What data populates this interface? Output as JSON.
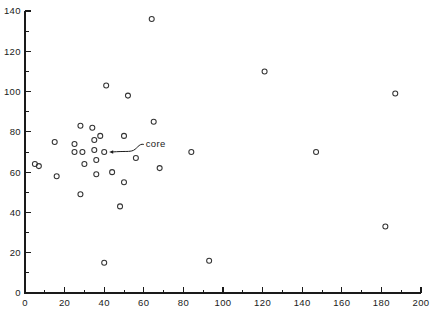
{
  "chart_data": {
    "type": "scatter",
    "title": "",
    "xlabel": "",
    "ylabel": "",
    "xlim": [
      0,
      200
    ],
    "ylim": [
      0,
      140
    ],
    "grid": false,
    "legend": null,
    "x_ticks": [
      0,
      20,
      40,
      60,
      80,
      100,
      120,
      140,
      160,
      180,
      200
    ],
    "x_tick_labels": [
      "0",
      "20",
      "40",
      "60",
      "80",
      "100",
      "120",
      "140",
      "160",
      "180",
      "200"
    ],
    "x_minor_step": 10,
    "y_ticks": [
      0,
      20,
      40,
      60,
      80,
      100,
      120,
      140
    ],
    "y_tick_labels": [
      "0",
      "20",
      "40",
      "60",
      "80",
      "100",
      "120",
      "140"
    ],
    "y_minor_step": 10,
    "marker": "open-circle",
    "marker_radius": 2.5,
    "points": [
      {
        "x": 7,
        "y": 63
      },
      {
        "x": 5,
        "y": 64
      },
      {
        "x": 15,
        "y": 75
      },
      {
        "x": 16,
        "y": 58
      },
      {
        "x": 25,
        "y": 74
      },
      {
        "x": 25,
        "y": 70
      },
      {
        "x": 28,
        "y": 83
      },
      {
        "x": 28,
        "y": 49
      },
      {
        "x": 29,
        "y": 70
      },
      {
        "x": 30,
        "y": 64
      },
      {
        "x": 34,
        "y": 82
      },
      {
        "x": 35,
        "y": 76
      },
      {
        "x": 35,
        "y": 71
      },
      {
        "x": 36,
        "y": 66
      },
      {
        "x": 36,
        "y": 59
      },
      {
        "x": 38,
        "y": 78
      },
      {
        "x": 40,
        "y": 70
      },
      {
        "x": 40,
        "y": 15
      },
      {
        "x": 41,
        "y": 103
      },
      {
        "x": 44,
        "y": 60
      },
      {
        "x": 48,
        "y": 43
      },
      {
        "x": 50,
        "y": 78
      },
      {
        "x": 50,
        "y": 55
      },
      {
        "x": 52,
        "y": 98
      },
      {
        "x": 56,
        "y": 67
      },
      {
        "x": 64,
        "y": 136
      },
      {
        "x": 65,
        "y": 85
      },
      {
        "x": 68,
        "y": 62
      },
      {
        "x": 84,
        "y": 70
      },
      {
        "x": 93,
        "y": 16
      },
      {
        "x": 121,
        "y": 110
      },
      {
        "x": 147,
        "y": 70
      },
      {
        "x": 182,
        "y": 33
      },
      {
        "x": 187,
        "y": 99
      }
    ],
    "annotations": [
      {
        "label": "core",
        "target_x": 40,
        "target_y": 70,
        "label_x": 60,
        "label_y": 75
      }
    ]
  }
}
